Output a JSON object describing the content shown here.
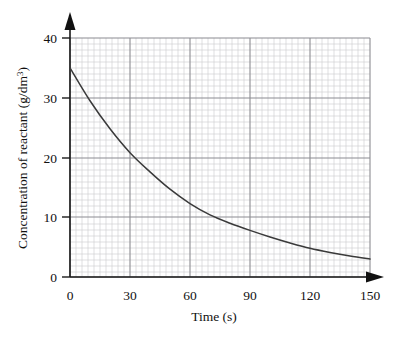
{
  "chart_data": {
    "type": "line",
    "title": "",
    "xlabel": "Time (s)",
    "ylabel": "Concentration of reactant (g/dm³)",
    "ylabel_base": "Concentration of reactant (g/dm",
    "ylabel_sup": "3",
    "ylabel_close": ")",
    "xlim": [
      0,
      150
    ],
    "ylim": [
      0,
      40
    ],
    "xticks": [
      0,
      30,
      60,
      90,
      120,
      150
    ],
    "xtick_labels": [
      "0",
      "30",
      "60",
      "90",
      "120",
      "150"
    ],
    "yticks": [
      0,
      10,
      20,
      30,
      40
    ],
    "ytick_labels": [
      "0",
      "10",
      "20",
      "30",
      "40"
    ],
    "grid": true,
    "grid_major_step_x": 30,
    "grid_major_step_y": 10,
    "grid_minor_step_x": 3,
    "grid_minor_step_y": 1,
    "legend": "none",
    "series": [
      {
        "name": "reactant concentration",
        "color": "#3a3a3a",
        "x": [
          0,
          10,
          20,
          30,
          40,
          50,
          60,
          70,
          80,
          90,
          100,
          110,
          120,
          130,
          140,
          150
        ],
        "values": [
          35.0,
          29.5,
          24.8,
          20.8,
          17.6,
          14.7,
          12.3,
          10.4,
          9.0,
          7.8,
          6.7,
          5.7,
          4.8,
          4.1,
          3.5,
          3.0
        ]
      }
    ],
    "annotations": [],
    "axis_arrows": {
      "x_axis_arrow": "right-arrow",
      "y_axis_arrow": "up-arrow"
    }
  },
  "colors": {
    "curve": "#3a3a3a",
    "axis": "#1a1a1a",
    "grid_major": "#8c8c92",
    "grid_minor": "#c9c9cf",
    "background": "#ffffff",
    "text": "#111111"
  }
}
